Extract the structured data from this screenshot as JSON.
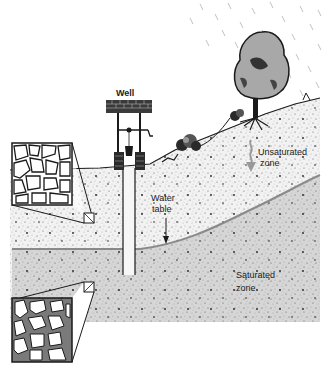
{
  "diagram": {
    "type": "groundwater cross-section",
    "labels": {
      "well": "Well",
      "unsaturated_line1": "Unsaturated",
      "unsaturated_line2": "zone",
      "water_line1": "Water",
      "water_line2": "table",
      "saturated_line1": "Saturated",
      "saturated_line2": "zone"
    },
    "elements": [
      "rain",
      "tree",
      "shrubs",
      "well",
      "ground-surface",
      "unsaturated-zone",
      "water-table",
      "saturated-zone",
      "inset-unsaturated-pores",
      "inset-saturated-pores",
      "infiltration-arrow",
      "water-table-arrow"
    ],
    "colors": {
      "saturated_fill": "#d6d6d6",
      "unsaturated_fill": "#f2f2f2",
      "water_table_line": "#8a8a8a",
      "ink": "#1a1a1a",
      "pore_water": "#7a7a7a",
      "tree_canopy": "#a8a8a8"
    }
  }
}
